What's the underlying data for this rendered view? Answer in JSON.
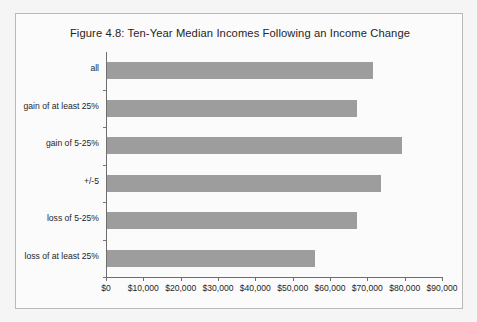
{
  "figure": {
    "title": "Figure 4.8: Ten-Year Median Incomes Following an Income Change",
    "background_color": "#f5f5f5",
    "panel_color": "#fbfbfb",
    "border_color": "#b9b9b9",
    "bar_color": "#9d9d9d",
    "axis_color": "#6e6e6e",
    "text_color": "#1f1f1f"
  },
  "chart_data": {
    "type": "bar",
    "orientation": "horizontal",
    "title": "Figure 4.8: Ten-Year Median Incomes Following an Income Change",
    "xlabel": "",
    "ylabel": "",
    "categories": [
      "all",
      "gain of at least 25%",
      "gain of 5-25%",
      "+/-5",
      "loss of 5-25%",
      "loss of at least 25%"
    ],
    "values": [
      71250,
      67000,
      79000,
      73500,
      67000,
      55700
    ],
    "value_labels": [
      "$71,250",
      "$67,000",
      "$79,000",
      "$73,500",
      "$67,000",
      "$55,700"
    ],
    "xlim": [
      0,
      90000
    ],
    "xticks": [
      0,
      10000,
      20000,
      30000,
      40000,
      50000,
      60000,
      70000,
      80000,
      90000
    ],
    "xticklabels": [
      "$0",
      "$10,000",
      "$20,000",
      "$30,000",
      "$40,000",
      "$50,000",
      "$60,000",
      "$70,000",
      "$80,000",
      "$90,000"
    ],
    "grid": false,
    "legend": null,
    "series": [
      {
        "name": "Ten-Year Median Income",
        "values": [
          71250,
          67000,
          79000,
          73500,
          67000,
          55700
        ]
      }
    ]
  }
}
